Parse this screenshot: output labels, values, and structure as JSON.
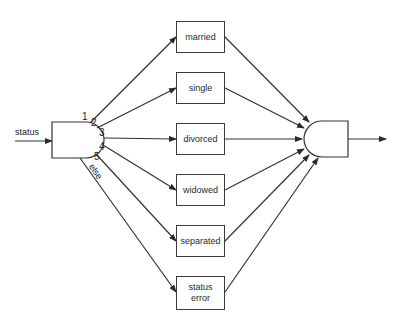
{
  "input": {
    "label": "status"
  },
  "branch_labels": [
    "1",
    "2",
    "3",
    "4",
    "5",
    "else"
  ],
  "boxes": [
    {
      "label": "married"
    },
    {
      "label": "single"
    },
    {
      "label": "divorced"
    },
    {
      "label": "widowed"
    },
    {
      "label": "separated"
    },
    {
      "label": "status\nerror"
    }
  ],
  "colors": {
    "stroke": "#333333",
    "background": "#ffffff"
  }
}
